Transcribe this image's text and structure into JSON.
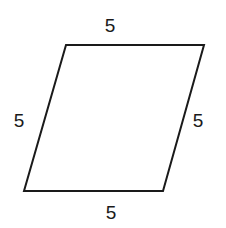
{
  "figure": {
    "name": "parallelogram",
    "shape_type": "parallelogram",
    "stroke_color": "#1a1a1a",
    "fill_color": "#ffffff",
    "background_color": "#ffffff",
    "stroke_width": 2,
    "vertices": [
      {
        "name": "top-left",
        "x": 66,
        "y": 45
      },
      {
        "name": "top-right",
        "x": 204,
        "y": 45
      },
      {
        "name": "bottom-right",
        "x": 163,
        "y": 191
      },
      {
        "name": "bottom-left",
        "x": 24,
        "y": 191
      }
    ],
    "points_attr": "66,45 204,45 163,191 24,191",
    "labels": {
      "top": "5",
      "right": "5",
      "bottom": "5",
      "left": "5"
    }
  },
  "chart_data": {
    "type": "diagram",
    "title": "",
    "shape": "parallelogram",
    "side_lengths": [
      5,
      5,
      5,
      5
    ],
    "side_label_positions": [
      "top",
      "left",
      "right",
      "bottom"
    ],
    "vertices_px": [
      [
        66,
        45
      ],
      [
        204,
        45
      ],
      [
        163,
        191
      ],
      [
        24,
        191
      ]
    ],
    "grid": false,
    "legend": false
  }
}
